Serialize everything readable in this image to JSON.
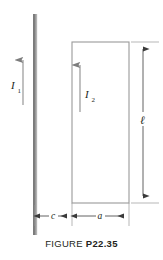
{
  "figure": {
    "caption_word": "FIGURE",
    "caption_number": "P22.35",
    "labels": {
      "current_1": "I",
      "current_1_sub": "1",
      "current_2": "I",
      "current_2_sub": "2",
      "length": "ℓ",
      "distance_c": "c",
      "width_a": "a"
    },
    "colors": {
      "wire_dark": "#6e6e6e",
      "wire_light": "#b8b8b8",
      "outline": "#9a9a9a",
      "arrow": "#808080",
      "text": "#231f20",
      "background": "#ffffff"
    },
    "geometry": {
      "wire_x": 33,
      "wire_width": 4,
      "wire_top": 14,
      "wire_bottom": 235,
      "loop_left": 72,
      "loop_right": 129,
      "loop_top": 42,
      "loop_bottom": 203,
      "dim_line_x": 143,
      "dim_row_y": 216
    }
  }
}
